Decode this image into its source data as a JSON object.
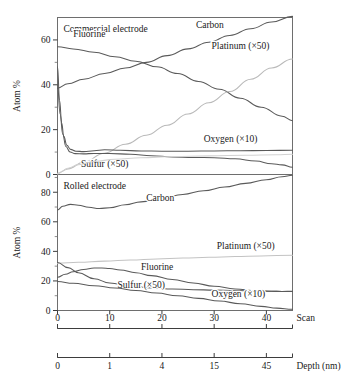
{
  "figure": {
    "background": "#ffffff",
    "ink_color": "#3d3d3d"
  },
  "chart_data": {
    "type": "line",
    "title": "",
    "panels": [
      {
        "name": "top-panel",
        "panel_title": "Commercial electrode",
        "xlabel": "",
        "ylabel": "Atom %",
        "xlim": [
          0,
          45
        ],
        "ylim": [
          0,
          70
        ],
        "yticks": [
          0,
          20,
          40,
          60
        ],
        "yticklabels": [
          "0",
          "20",
          "40",
          "60"
        ],
        "grid": false,
        "series": [
          {
            "name": "Carbon",
            "label": "Carbon",
            "color": "#5a5a5a",
            "label_x": 26.5,
            "label_y": 65.5,
            "x": [
              0,
              2,
              5,
              9,
              13,
              17,
              21,
              25,
              29,
              33,
              37,
              41,
              45
            ],
            "y": [
              38.5,
              40.5,
              42.5,
              45.0,
              47.5,
              50.0,
              53.0,
              56.0,
              59.0,
              62.0,
              65.0,
              68.0,
              70.5
            ]
          },
          {
            "name": "Fluorine",
            "label": "Fluorine",
            "color": "#5a5a5a",
            "label_x": 3.0,
            "label_y": 61.5,
            "x": [
              0,
              3,
              7,
              11,
              15,
              19,
              23,
              27,
              31,
              35,
              39,
              43,
              45
            ],
            "y": [
              57.0,
              56.0,
              54.5,
              52.5,
              50.5,
              48.0,
              45.0,
              41.5,
              38.0,
              34.0,
              30.0,
              26.0,
              24.0
            ]
          },
          {
            "name": "Platinum (x50)",
            "label": "Platinum (×50)",
            "color": "#b9b9b9",
            "label_x": 29.5,
            "label_y": 56.0,
            "x": [
              0,
              2,
              5,
              9,
              13,
              17,
              21,
              25,
              29,
              33,
              37,
              41,
              45
            ],
            "y": [
              0.5,
              2.5,
              5.5,
              9.5,
              13.5,
              17.5,
              22.0,
              27.0,
              32.0,
              37.0,
              42.5,
              47.5,
              51.5
            ]
          },
          {
            "name": "Oxygen (x10)",
            "label": "Oxygen (×10)",
            "color": "#5a5a5a",
            "label_x": 28.0,
            "label_y": 14.5,
            "x": [
              0,
              0.4,
              0.8,
              1.2,
              1.8,
              2.5,
              3.5,
              5,
              7,
              9,
              12,
              16,
              20,
              25,
              30,
              35,
              40,
              45
            ],
            "y": [
              48.0,
              33.0,
              23.0,
              17.0,
              13.0,
              11.2,
              10.4,
              10.2,
              10.6,
              11.0,
              10.8,
              10.5,
              10.4,
              10.4,
              10.5,
              10.6,
              10.7,
              10.8
            ]
          },
          {
            "name": "Sulfur (x50)",
            "label": "Sulfur (×50)",
            "color": "#5a5a5a",
            "label_x": 4.5,
            "label_y": 3.5,
            "x": [
              0,
              0.5,
              1.0,
              1.6,
              2.4,
              3.4,
              5,
              7,
              10,
              14,
              18,
              22,
              26,
              30,
              34,
              38,
              41,
              43,
              45
            ],
            "y": [
              40.0,
              27.0,
              18.0,
              12.5,
              10.0,
              9.3,
              9.2,
              9.4,
              9.4,
              9.0,
              8.4,
              7.8,
              7.6,
              7.5,
              7.0,
              6.0,
              4.8,
              4.3,
              3.2
            ]
          },
          {
            "name": "Baseline-rise",
            "label": "",
            "color": "#d2d2d2",
            "label_x": null,
            "label_y": null,
            "x": [
              0,
              1,
              2,
              4,
              7,
              11,
              16,
              22,
              29,
              36,
              42,
              45
            ],
            "y": [
              0.2,
              1.6,
              2.8,
              4.4,
              5.8,
              6.8,
              7.5,
              8.0,
              8.3,
              8.6,
              8.8,
              9.0
            ]
          }
        ]
      },
      {
        "name": "bottom-panel",
        "panel_title": "Rolled electrode",
        "xlabel": "",
        "ylabel": "Atom %",
        "xlim": [
          0,
          45
        ],
        "ylim": [
          0,
          92
        ],
        "yticks": [
          0,
          20,
          40,
          60,
          80
        ],
        "yticklabels": [
          "0",
          "20",
          "40",
          "60",
          "80"
        ],
        "grid": false,
        "series": [
          {
            "name": "Carbon",
            "label": "Carbon",
            "color": "#5a5a5a",
            "label_x": 17.0,
            "label_y": 74.0,
            "x": [
              0,
              1,
              2.5,
              4,
              6,
              8,
              10,
              13,
              16,
              20,
              24,
              28,
              32,
              36,
              40,
              43,
              45
            ],
            "y": [
              68.0,
              70.5,
              71.8,
              71.2,
              69.8,
              69.0,
              69.5,
              71.5,
              73.5,
              76.0,
              78.5,
              81.0,
              83.5,
              86.0,
              88.5,
              90.5,
              91.5
            ]
          },
          {
            "name": "Platinum (x50)",
            "label": "Platinum (×50)",
            "color": "#c3c3c3",
            "label_x": 30.5,
            "label_y": 41.5,
            "x": [
              0,
              4,
              9,
              14,
              19,
              24,
              29,
              34,
              39,
              45
            ],
            "y": [
              32.0,
              32.6,
              33.4,
              34.2,
              34.9,
              35.5,
              36.0,
              36.5,
              36.9,
              37.4
            ]
          },
          {
            "name": "Fluorine",
            "label": "Fluorine",
            "color": "#5a5a5a",
            "label_x": 16.0,
            "label_y": 27.5,
            "x": [
              0,
              1.5,
              3,
              5,
              7,
              8.5,
              10,
              12,
              15,
              18,
              22,
              26,
              30,
              34,
              38,
              41,
              43,
              45
            ],
            "y": [
              22.5,
              24.5,
              26.2,
              27.8,
              28.7,
              28.8,
              28.4,
              27.4,
              25.6,
              23.6,
              21.0,
              18.6,
              16.4,
              14.6,
              13.4,
              13.0,
              12.9,
              13.0
            ]
          },
          {
            "name": "Sulfur (x50)",
            "label": "Sulfur (×50)",
            "color": "#5a5a5a",
            "label_x": 11.5,
            "label_y": 15.5,
            "x": [
              0,
              2,
              4,
              7,
              10,
              14,
              18,
              22,
              26,
              30,
              34,
              38,
              41,
              43,
              45
            ],
            "y": [
              32.5,
              29.0,
              25.5,
              21.5,
              18.6,
              16.5,
              15.3,
              14.6,
              14.1,
              13.8,
              13.5,
              13.2,
              13.0,
              12.9,
              12.8
            ]
          },
          {
            "name": "Oxygen (x10)",
            "label": "Oxygen (×10)",
            "color": "#5a5a5a",
            "label_x": 29.5,
            "label_y": 9.0,
            "x": [
              0,
              3,
              7,
              11,
              15,
              19,
              23,
              27,
              31,
              35,
              39,
              42,
              45
            ],
            "y": [
              19.6,
              18.4,
              16.8,
              15.2,
              13.5,
              11.8,
              10.0,
              8.2,
              6.4,
              4.6,
              2.8,
              1.6,
              0.8
            ]
          }
        ]
      }
    ],
    "scan_axis": {
      "title": "Scan",
      "ticks": [
        0,
        10,
        20,
        30,
        40
      ],
      "ticklabels": [
        "0",
        "10",
        "20",
        "30",
        "40"
      ]
    },
    "depth_axis": {
      "title": "Depth (nm)",
      "tick_positions": [
        0,
        10,
        20,
        30,
        40
      ],
      "ticklabels": [
        "0",
        "1",
        "4",
        "15",
        "45"
      ]
    }
  }
}
